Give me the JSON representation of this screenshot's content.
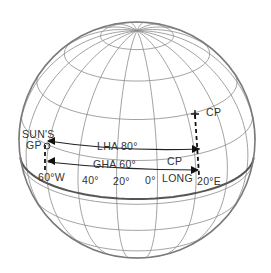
{
  "diagram": {
    "labels": {
      "suns_gp_line1": "SUN'S",
      "suns_gp_line2": "GP",
      "cp_top": "CP",
      "lha": "LHA 80°",
      "gha": "GHA 60°",
      "cp_mid": "CP",
      "long": "LONG",
      "w60": "60°W",
      "l40": "40°",
      "l20": "20°",
      "l0": "0°",
      "e20": "20°E"
    },
    "values": {
      "lha_degrees": 80,
      "gha_degrees": 60,
      "sun_gp_longitude": "60°W",
      "observer_longitude": "20°E"
    },
    "colors": {
      "grid": "#8a8a8a",
      "outline": "#7a7a7a",
      "arrows": "#222222"
    }
  }
}
